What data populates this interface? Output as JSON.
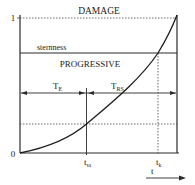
{
  "diagram": {
    "title_top": "DAMAGE",
    "band_label": "PROGRESSIVE",
    "threshold_label": "sternness",
    "y_max_label": "1",
    "origin_label": "0",
    "interval_1": {
      "main": "T",
      "sub": "E"
    },
    "interval_2": {
      "main": "T",
      "sub": "RS"
    },
    "tick_1": {
      "main": "t",
      "sub": "sa"
    },
    "tick_2": {
      "main": "t",
      "sub": "k"
    },
    "time_axis_label": "t"
  },
  "colors": {
    "line": "#2a2a2a",
    "curve": "#1e1e1e",
    "dotted": "#444444"
  }
}
